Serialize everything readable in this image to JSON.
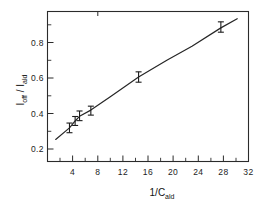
{
  "chart_data": {
    "type": "scatter",
    "title": "",
    "subtitle": "",
    "xlabel": "1/C_ald",
    "xlabel_main": "1/C",
    "xlabel_sub": "ald",
    "ylabel": "I_off / I_ald",
    "ylabel_num_main": "I",
    "ylabel_num_sub": "off",
    "ylabel_sep": " / ",
    "ylabel_den_main": "I",
    "ylabel_den_sub": "ald",
    "xlim": [
      0,
      32
    ],
    "ylim": [
      0.13,
      1.0
    ],
    "xticks": [
      4,
      8,
      12,
      16,
      20,
      24,
      28,
      32
    ],
    "xticklabels": [
      "4",
      "8",
      "12",
      "16",
      "20",
      "24",
      "28",
      "32"
    ],
    "xminorticks": [
      2,
      6,
      10,
      14,
      18,
      22,
      26,
      30
    ],
    "yticks": [
      0.2,
      0.4,
      0.6,
      0.8
    ],
    "yticklabels": [
      "0.2",
      "0.4",
      "0.6",
      "0.8"
    ],
    "yminorticks": [
      0.3,
      0.5,
      0.7,
      0.9
    ],
    "grid": false,
    "legend": "none",
    "frame": "box",
    "series": [
      {
        "name": "I_off / I_ald",
        "marker": "errorbar",
        "color": "#1c1c1c",
        "x": [
          3.5,
          4.4,
          5.1,
          6.9,
          14.5,
          27.6
        ],
        "y": [
          0.325,
          0.365,
          0.395,
          0.425,
          0.62,
          0.91
        ],
        "yerr": [
          0.028,
          0.026,
          0.028,
          0.026,
          0.03,
          0.03
        ]
      }
    ],
    "curve": {
      "name": "fit-curve",
      "color": "#262626",
      "x": [
        1.3,
        3.5,
        4.4,
        5.1,
        6.9,
        10.0,
        14.5,
        19.0,
        23.0,
        27.6,
        30.2
      ],
      "y": [
        0.258,
        0.325,
        0.365,
        0.392,
        0.428,
        0.505,
        0.62,
        0.717,
        0.798,
        0.905,
        0.958
      ]
    }
  }
}
